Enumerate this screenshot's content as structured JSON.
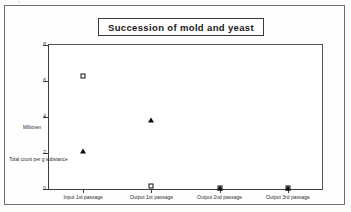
{
  "figure": {
    "title": "Succession of mold and yeast"
  },
  "legend": {
    "position": "top-right",
    "entries": [
      {
        "label": "Yeast",
        "marker": "open-square-icon"
      },
      {
        "label": "Mold",
        "marker": "filled-triangle-icon"
      }
    ]
  },
  "axes": {
    "y_caption_unit": "Millionen",
    "y_caption_main": "Total count per g substance",
    "y_ticks": [
      "0",
      "2",
      "4",
      "6",
      "8"
    ]
  },
  "chart_data": {
    "type": "scatter",
    "title": "Succession of mold and yeast",
    "xlabel": "",
    "ylabel": "Total count per g substance",
    "y_unit": "Millionen",
    "categories": [
      "Input 1st passage",
      "Output 1st passage",
      "Output 2nd passage",
      "Output 3rd passage"
    ],
    "series": [
      {
        "name": "Yeast",
        "marker": "open-square",
        "values": [
          6.3,
          0.15,
          0.05,
          0.05
        ]
      },
      {
        "name": "Mold",
        "marker": "filled-triangle",
        "values": [
          2.1,
          3.85,
          0.05,
          0.05
        ]
      }
    ],
    "ylim": [
      0,
      8
    ],
    "yticks": [
      0,
      2,
      4,
      6,
      8
    ],
    "grid": false,
    "legend_position": "top-right"
  }
}
